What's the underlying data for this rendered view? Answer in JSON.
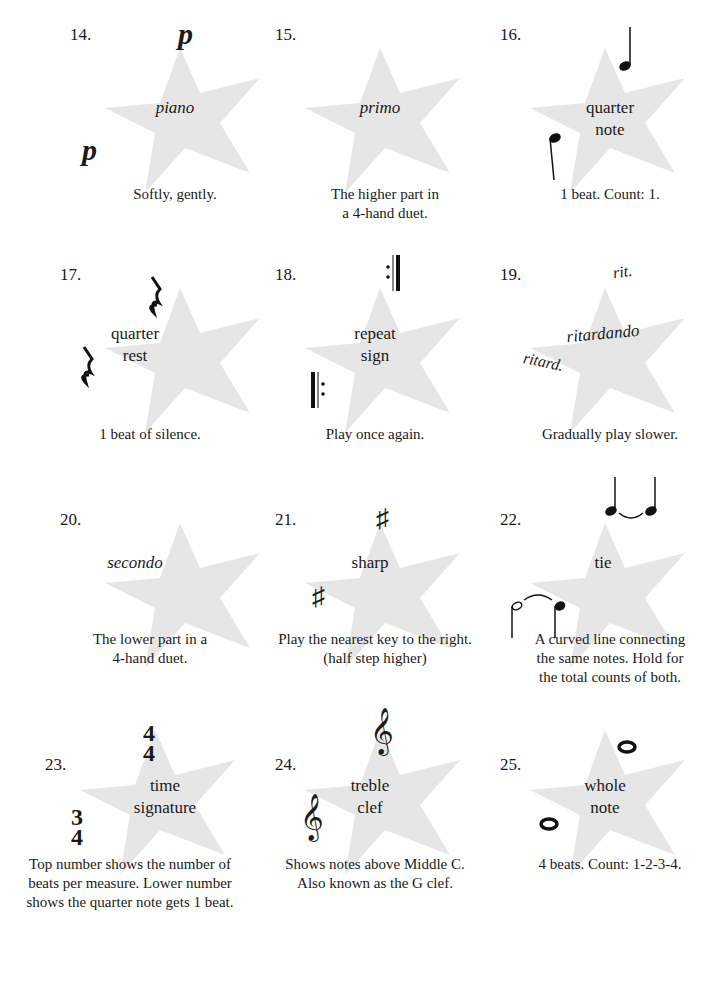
{
  "cards": [
    {
      "number": "14.",
      "term": "piano",
      "italic": true,
      "description": [
        "Softly, gently."
      ],
      "symbols": [
        "p",
        "p"
      ]
    },
    {
      "number": "15.",
      "term": "primo",
      "italic": true,
      "description": [
        "The higher part in",
        "a 4-hand duet."
      ]
    },
    {
      "number": "16.",
      "term": "quarter note",
      "term_lines": [
        "quarter",
        "note"
      ],
      "description": [
        "1 beat. Count: 1."
      ]
    },
    {
      "number": "17.",
      "term_lines": [
        "quarter",
        "rest"
      ],
      "description": [
        "1 beat of silence."
      ]
    },
    {
      "number": "18.",
      "term_lines": [
        "repeat",
        "sign"
      ],
      "description": [
        "Play once again."
      ]
    },
    {
      "number": "19.",
      "term": "ritardando",
      "italic": true,
      "description": [
        "Gradually play slower."
      ],
      "symbols": [
        "rit.",
        "ritard."
      ]
    },
    {
      "number": "20.",
      "term": "secondo",
      "italic": true,
      "description": [
        "The lower part in a",
        "4-hand duet."
      ]
    },
    {
      "number": "21.",
      "term": "sharp",
      "description": [
        "Play the nearest key to the right.",
        "(half step higher)"
      ],
      "symbols": [
        "♯",
        "♯"
      ]
    },
    {
      "number": "22.",
      "term": "tie",
      "description": [
        "A curved line connecting",
        "the same notes. Hold for",
        "the total counts of both."
      ]
    },
    {
      "number": "23.",
      "term_lines": [
        "time",
        "signature"
      ],
      "description": [
        "Top number shows the number of",
        "beats per measure. Lower number",
        "shows the quarter note gets 1 beat."
      ],
      "symbols": [
        [
          "4",
          "4"
        ],
        [
          "3",
          "4"
        ]
      ]
    },
    {
      "number": "24.",
      "term_lines": [
        "treble",
        "clef"
      ],
      "description": [
        "Shows notes above Middle C.",
        "Also known as the G clef."
      ],
      "symbols": [
        "𝄞",
        "𝄞"
      ]
    },
    {
      "number": "25.",
      "term_lines": [
        "whole",
        "note"
      ],
      "description": [
        "4 beats. Count: 1-2-3-4."
      ]
    }
  ],
  "colors": {
    "star": "#e6e6e6",
    "text": "#1a1a1a"
  }
}
